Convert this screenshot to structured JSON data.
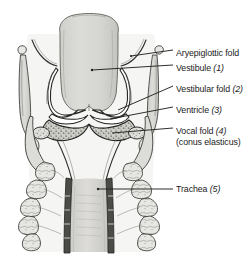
{
  "figure": {
    "background_color": "#ffffff",
    "ink_color": "#1b1b1b",
    "tissue_fill": "#d6d6d3",
    "tissue_fill_dark": "#b9b9b5",
    "cartilage_fill": "#e3e3df",
    "leader_color": "#2a2a2a"
  },
  "labels": [
    {
      "id": "aryepiglottic-fold",
      "text": "Aryepiglottic fold",
      "number": "",
      "x": 176,
      "y": 53
    },
    {
      "id": "vestibule",
      "text": "Vestibule",
      "number": "(1)",
      "x": 176,
      "y": 68
    },
    {
      "id": "vestibular-fold",
      "text": "Vestibular fold",
      "number": "(2)",
      "x": 176,
      "y": 89
    },
    {
      "id": "ventricle",
      "text": "Ventricle",
      "number": "(3)",
      "x": 176,
      "y": 110
    },
    {
      "id": "vocal-fold",
      "text": "Vocal fold",
      "number": "(4)",
      "subtext": "(conus elasticus)",
      "x": 176,
      "y": 131
    },
    {
      "id": "trachea",
      "text": "Trachea",
      "number": "(5)",
      "x": 176,
      "y": 185
    }
  ]
}
